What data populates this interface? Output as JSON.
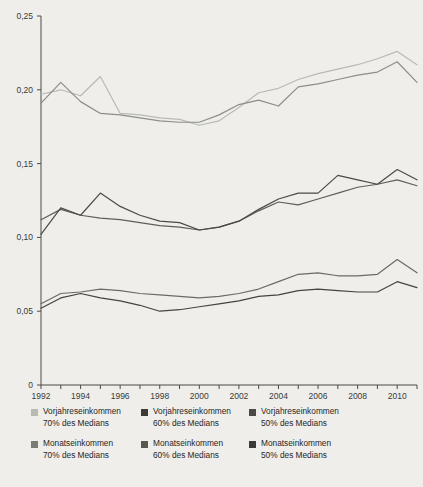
{
  "chart_data": {
    "type": "line",
    "title": "",
    "xlabel": "",
    "ylabel": "",
    "xlim": [
      1992,
      2011
    ],
    "ylim": [
      0,
      0.25
    ],
    "grid": false,
    "legend_position": "bottom",
    "x": [
      1992,
      1993,
      1994,
      1995,
      1996,
      1997,
      1998,
      1999,
      2000,
      2001,
      2002,
      2003,
      2004,
      2005,
      2006,
      2007,
      2008,
      2009,
      2010,
      2011
    ],
    "y_ticks": [
      0,
      0.05,
      0.1,
      0.15,
      0.2,
      0.25
    ],
    "y_tick_labels": [
      "0",
      "0,05",
      "0,10",
      "0,15",
      "0,20",
      "0,25"
    ],
    "x_ticks": [
      1992,
      1993,
      1994,
      1995,
      1996,
      1997,
      1998,
      1999,
      2000,
      2001,
      2002,
      2003,
      2004,
      2005,
      2006,
      2007,
      2008,
      2009,
      2010,
      2011
    ],
    "x_tick_labels": [
      "1992",
      "",
      "1994",
      "",
      "1996",
      "",
      "1998",
      "",
      "2000",
      "",
      "2002",
      "",
      "2004",
      "",
      "2006",
      "",
      "2008",
      "",
      "2010",
      ""
    ],
    "series": [
      {
        "name": "Vorjahreseinkommen 70% des Medians",
        "color": "#b9bab4",
        "values": [
          0.197,
          0.2,
          0.196,
          0.209,
          0.184,
          0.183,
          0.181,
          0.18,
          0.176,
          0.179,
          0.188,
          0.198,
          0.201,
          0.207,
          0.211,
          0.214,
          0.217,
          0.221,
          0.226,
          0.217
        ]
      },
      {
        "name": "Monatseinkommen 70% des Medians",
        "color": "#8c8e88",
        "values": [
          0.191,
          0.205,
          0.192,
          0.184,
          0.183,
          0.181,
          0.179,
          0.178,
          0.178,
          0.183,
          0.19,
          0.193,
          0.189,
          0.202,
          0.204,
          0.207,
          0.21,
          0.212,
          0.219,
          0.205
        ]
      },
      {
        "name": "Vorjahreseinkommen 60% des Medians",
        "color": "#5e5f5a",
        "values": [
          0.112,
          0.119,
          0.115,
          0.113,
          0.112,
          0.11,
          0.108,
          0.107,
          0.105,
          0.107,
          0.111,
          0.118,
          0.124,
          0.122,
          0.126,
          0.13,
          0.134,
          0.136,
          0.139,
          0.135
        ]
      },
      {
        "name": "Monatseinkommen 60% des Medians",
        "color": "#4a4b46",
        "values": [
          0.102,
          0.12,
          0.115,
          0.13,
          0.121,
          0.115,
          0.111,
          0.11,
          0.105,
          0.107,
          0.111,
          0.119,
          0.126,
          0.13,
          0.13,
          0.142,
          0.139,
          0.136,
          0.146,
          0.139
        ]
      },
      {
        "name": "Vorjahreseinkommen 50% des Medians",
        "color": "#6a6b66",
        "values": [
          0.055,
          0.062,
          0.063,
          0.065,
          0.064,
          0.062,
          0.061,
          0.06,
          0.059,
          0.06,
          0.062,
          0.065,
          0.07,
          0.075,
          0.076,
          0.074,
          0.074,
          0.075,
          0.085,
          0.076
        ]
      },
      {
        "name": "Monatseinkommen 50% des Medians",
        "color": "#44453f",
        "values": [
          0.052,
          0.059,
          0.062,
          0.059,
          0.057,
          0.054,
          0.05,
          0.051,
          0.053,
          0.055,
          0.057,
          0.06,
          0.061,
          0.064,
          0.065,
          0.064,
          0.063,
          0.063,
          0.07,
          0.066
        ]
      }
    ]
  },
  "legend": {
    "items": [
      {
        "line1": "Vorjahreseinkommen",
        "line2": "70% des Medians",
        "color": "#b9bab4",
        "key": "vorjahr-70"
      },
      {
        "line1": "Vorjahreseinkommen",
        "line2": "60% des Medians",
        "color": "#3a3b36",
        "key": "vorjahr-60"
      },
      {
        "line1": "Vorjahreseinkommen",
        "line2": "50% des Medians",
        "color": "#4a4b46",
        "key": "vorjahr-50"
      },
      {
        "line1": "Monatseinkommen",
        "line2": "70% des Medians",
        "color": "#7a7b75",
        "key": "monat-70"
      },
      {
        "line1": "Monatseinkommen",
        "line2": "60% des Medians",
        "color": "#565751",
        "key": "monat-60"
      },
      {
        "line1": "Monatseinkommen",
        "line2": "50% des Medians",
        "color": "#3a3b36",
        "key": "monat-50"
      }
    ]
  },
  "style": {
    "background": "#efeeea",
    "axis_color": "#4a4b46",
    "tick_text_color": "#3a3a3a"
  }
}
